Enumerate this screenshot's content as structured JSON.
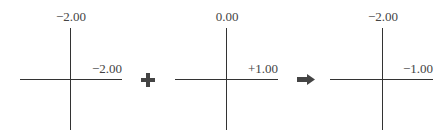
{
  "diagram": {
    "panels": [
      {
        "top_label": "−2.00",
        "right_label": "−2.00"
      },
      {
        "top_label": "0.00",
        "right_label": "+1.00"
      },
      {
        "top_label": "−2.00",
        "right_label": "−1.00"
      }
    ],
    "operators": [
      {
        "type": "plus-icon",
        "symbol": "+"
      },
      {
        "type": "arrow-right-icon",
        "symbol": "➡"
      }
    ],
    "colors": {
      "line": "#333333",
      "text": "#444444",
      "operator": "#444444"
    }
  }
}
